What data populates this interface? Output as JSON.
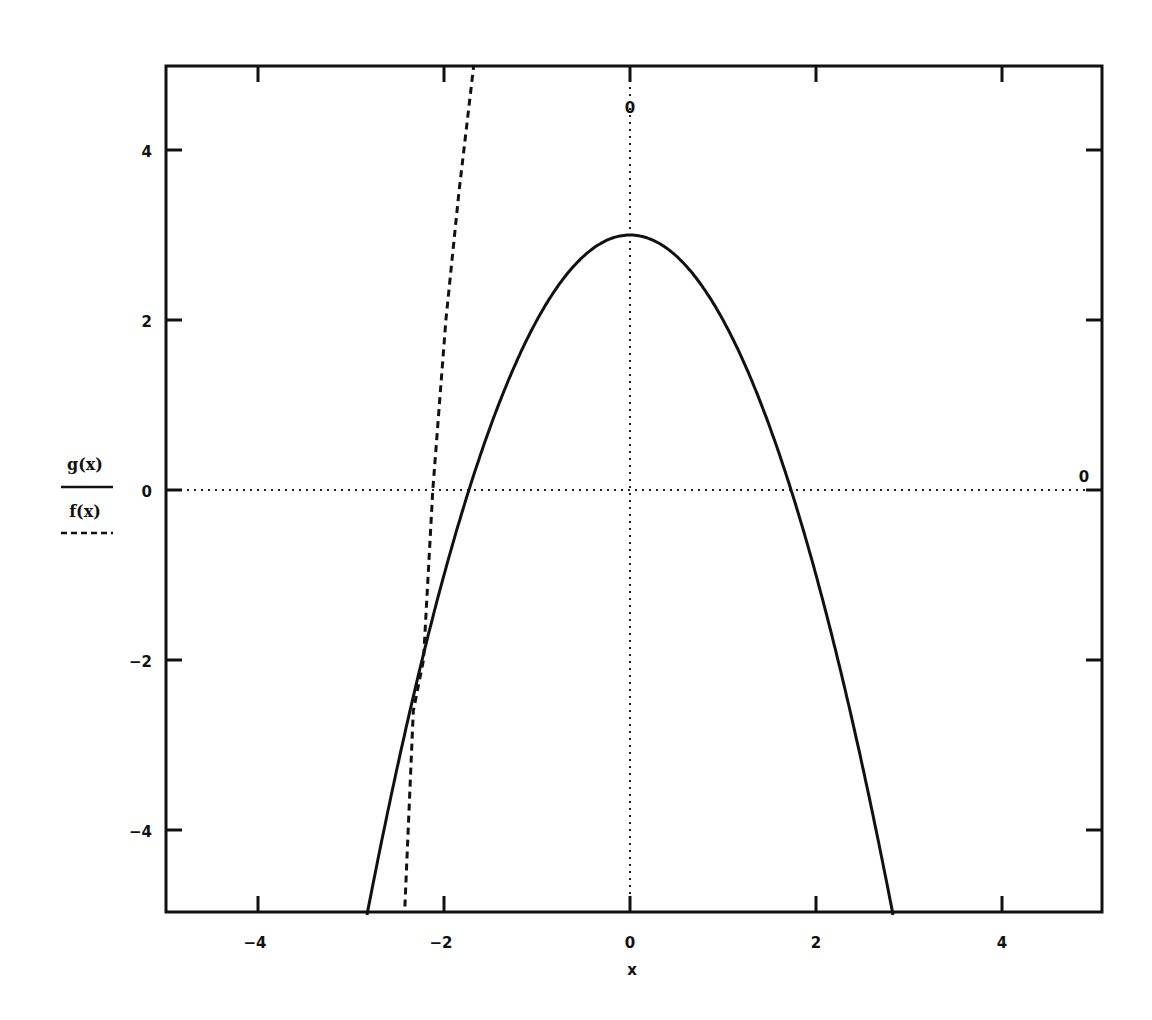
{
  "chart_data": {
    "type": "line",
    "title": "",
    "xlabel": "x",
    "ylabel": "",
    "xlim": [
      -5,
      5
    ],
    "ylim": [
      -5,
      5
    ],
    "grid": false,
    "x_ticks": [
      -4,
      -2,
      0,
      2,
      4
    ],
    "x_tick_labels": [
      "-4",
      "-2",
      "0",
      "2",
      "4"
    ],
    "y_ticks": [
      -4,
      -2,
      0,
      2,
      4
    ],
    "y_tick_labels": [
      "-4",
      "-2",
      "0",
      "2",
      "4"
    ],
    "axis_markers": {
      "x_axis_zero_label": "0",
      "y_axis_zero_label": "0"
    },
    "legend_position": "left",
    "series": [
      {
        "name": "g(x)",
        "style": "solid",
        "color": "#111111",
        "expression": "3 - x^2",
        "x": [
          -2.83,
          -2.5,
          -2.0,
          -1.732,
          -1.5,
          -1.0,
          -0.5,
          0.0,
          0.5,
          1.0,
          1.5,
          1.732,
          2.0,
          2.5,
          2.83
        ],
        "y": [
          -5.0,
          -3.25,
          -1.0,
          0.0,
          0.75,
          2.0,
          2.75,
          3.0,
          2.75,
          2.0,
          0.75,
          0.0,
          -1.0,
          -3.25,
          -5.0
        ]
      },
      {
        "name": "f(x)",
        "style": "dashed",
        "color": "#111111",
        "x": [
          -2.42,
          -2.33,
          -2.22,
          -2.12,
          -1.98,
          -1.84,
          -1.68
        ],
        "y": [
          -4.9,
          -2.6,
          -2.0,
          0.0,
          2.0,
          3.5,
          5.0
        ]
      }
    ]
  },
  "legend": {
    "items": [
      {
        "label": "g(x)",
        "style": "solid"
      },
      {
        "label": "f(x)",
        "style": "dashed"
      }
    ]
  },
  "axes": {
    "x_label": "x",
    "zero_label_top": "0",
    "zero_label_right": "0"
  }
}
